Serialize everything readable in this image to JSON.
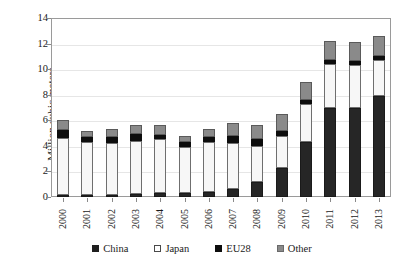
{
  "chart_data": {
    "type": "bar",
    "stacked": true,
    "title": "",
    "xlabel": "",
    "ylabel": "Million cubic meters",
    "ylim": [
      0,
      14
    ],
    "yticks": [
      0,
      2,
      4,
      6,
      8,
      10,
      12,
      14
    ],
    "grid": true,
    "legend_position": "bottom",
    "categories": [
      "2000",
      "2001",
      "2002",
      "2003",
      "2004",
      "2005",
      "2006",
      "2007",
      "2008",
      "2009",
      "2010",
      "2011",
      "2012",
      "2013"
    ],
    "series": [
      {
        "name": "China",
        "color": "#262626",
        "values": [
          0.1,
          0.1,
          0.15,
          0.2,
          0.3,
          0.3,
          0.4,
          0.6,
          1.2,
          2.3,
          4.3,
          7.0,
          7.0,
          7.9
        ]
      },
      {
        "name": "Japan",
        "color": "#f7f7f7",
        "values": [
          4.5,
          4.2,
          4.1,
          4.2,
          4.2,
          3.6,
          3.9,
          3.6,
          2.8,
          2.5,
          3.0,
          3.4,
          3.3,
          2.8
        ]
      },
      {
        "name": "EU28",
        "color": "#0d0d0d",
        "values": [
          0.6,
          0.4,
          0.45,
          0.5,
          0.35,
          0.4,
          0.4,
          0.6,
          0.5,
          0.4,
          0.3,
          0.3,
          0.3,
          0.3
        ]
      },
      {
        "name": "Other",
        "color": "#8a8a8a",
        "values": [
          0.8,
          0.5,
          0.6,
          0.7,
          0.75,
          0.5,
          0.6,
          1.0,
          1.1,
          1.3,
          1.4,
          1.5,
          1.5,
          1.6
        ]
      }
    ],
    "totals": [
      6.0,
      5.2,
      5.3,
      5.6,
      5.6,
      4.8,
      5.3,
      5.8,
      5.6,
      6.5,
      9.0,
      12.2,
      12.1,
      12.6
    ]
  },
  "legend": {
    "items": [
      {
        "label": "China",
        "swatch": "china-swatch"
      },
      {
        "label": "Japan",
        "swatch": "japan-swatch"
      },
      {
        "label": "EU28",
        "swatch": "eu28-swatch"
      },
      {
        "label": "Other",
        "swatch": "other-swatch"
      }
    ]
  }
}
